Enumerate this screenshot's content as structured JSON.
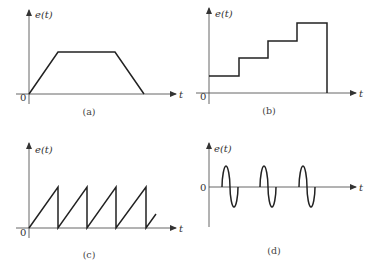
{
  "panels": [
    {
      "id": "a",
      "caption": "(a)",
      "y_label": "e(t)",
      "x_label": "t",
      "origin_label": "0",
      "shape": "trapezoid",
      "points": [
        [
          29,
          94
        ],
        [
          58,
          52
        ],
        [
          115,
          52
        ],
        [
          144,
          94
        ]
      ]
    },
    {
      "id": "b",
      "caption": "(b)",
      "y_label": "e(t)",
      "x_label": "t",
      "origin_label": "0",
      "shape": "staircase",
      "points": [
        [
          209,
          76
        ],
        [
          239,
          76
        ],
        [
          239,
          58
        ],
        [
          268,
          58
        ],
        [
          268,
          41
        ],
        [
          297,
          41
        ],
        [
          297,
          23
        ],
        [
          327,
          23
        ],
        [
          327,
          93
        ]
      ]
    },
    {
      "id": "c",
      "caption": "(c)",
      "y_label": "e(t)",
      "x_label": "t",
      "origin_label": "0",
      "shape": "sawtooth",
      "points": [
        [
          29,
          228
        ],
        [
          58,
          187
        ],
        [
          58,
          228
        ],
        [
          87,
          187
        ],
        [
          87,
          228
        ],
        [
          116,
          187
        ],
        [
          116,
          228
        ],
        [
          146,
          187
        ],
        [
          146,
          228
        ],
        [
          156,
          214
        ]
      ]
    },
    {
      "id": "d",
      "caption": "(d)",
      "y_label": "e(t)",
      "x_label": "t",
      "origin_label": "0",
      "shape": "sine bursts",
      "bursts": 3
    }
  ]
}
